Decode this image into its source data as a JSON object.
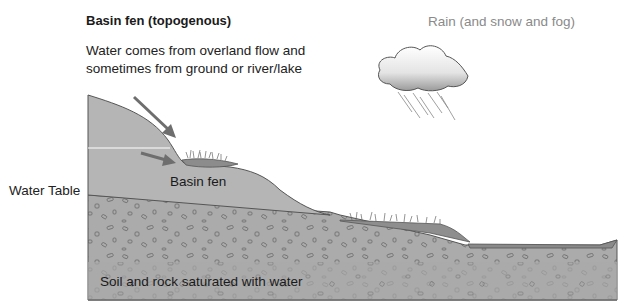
{
  "diagram": {
    "title": "Basin fen (topogenous)",
    "description": "Water comes from overland flow and\nsometimes from ground or river/lake",
    "precipitation_label": "Rain (and snow and fog)",
    "labels": {
      "water_table": "Water Table",
      "basin_fen": "Basin fen",
      "saturated_zone": "Soil and rock saturated with water"
    },
    "icons": [
      "rain-cloud-icon",
      "overland-flow-arrow-icon",
      "groundwater-flow-arrow-icon"
    ],
    "colors": {
      "upland_soil": "#b3b3b3",
      "saturated_rock": "#a8a8a8",
      "fen_water": "#8c8c8c",
      "arrow": "#6e6e6e",
      "outline": "#555555"
    }
  }
}
